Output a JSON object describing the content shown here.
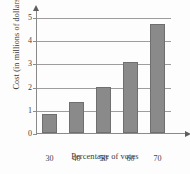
{
  "chart_data": {
    "type": "bar",
    "title": "",
    "xlabel": "Percentage of votes",
    "ylabel": "Cost (in millions of dollars)",
    "categories": [
      "30",
      "40",
      "50",
      "60",
      "70"
    ],
    "values": [
      0.8,
      1.35,
      2.0,
      3.05,
      4.7
    ],
    "ylim": [
      0,
      5
    ],
    "yticks": [
      "0",
      "1",
      "2",
      "3",
      "4",
      "5"
    ],
    "grid": true,
    "legend": "none",
    "bar_color": "#8a8a8a",
    "bar_edge_color": "#6f6f6f",
    "axis_color": "#8a8a8a",
    "grid_color": "#9d9d9d",
    "background": "#fdfdfd"
  }
}
